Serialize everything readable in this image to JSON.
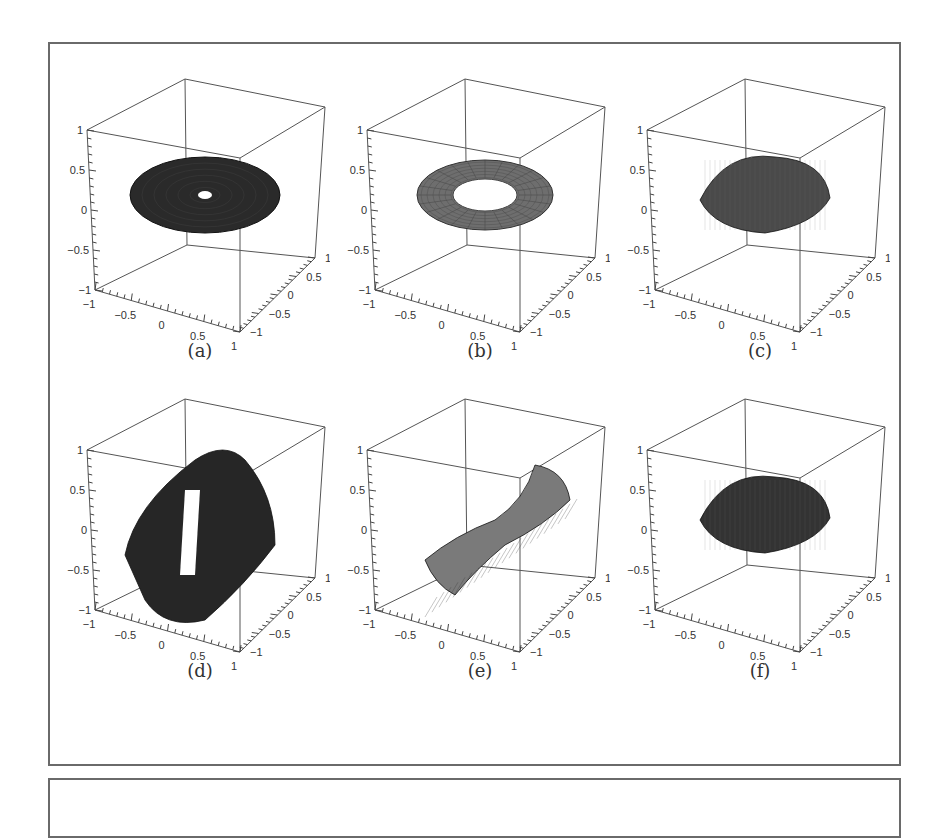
{
  "figure": {
    "panels": [
      {
        "id": "a",
        "caption": "(a)",
        "surface": "disk-with-small-hole",
        "shade": "#2a2a2a"
      },
      {
        "id": "b",
        "caption": "(b)",
        "surface": "annulus-ring",
        "shade": "#6e6e6e"
      },
      {
        "id": "c",
        "caption": "(c)",
        "surface": "ellipsoid-lens",
        "shade": "#4a4a4a"
      },
      {
        "id": "d",
        "caption": "(d)",
        "surface": "twisted-band-with-slit",
        "shade": "#262626"
      },
      {
        "id": "e",
        "caption": "(e)",
        "surface": "twisted-ribbon",
        "shade": "#7a7a7a"
      },
      {
        "id": "f",
        "caption": "(f)",
        "surface": "ellipsoid-lens",
        "shade": "#333333"
      }
    ],
    "axis_ticks": {
      "z": [
        "1",
        "0.5",
        "0",
        "−0.5",
        "−1"
      ],
      "x": [
        "−1",
        "−0.5",
        "0",
        "0.5",
        "1"
      ],
      "y": [
        "1",
        "0.5",
        "0",
        "−0.5",
        "−1"
      ]
    }
  },
  "chart_data": [
    {
      "type": "surface3d",
      "title": "(a)",
      "xlim": [
        -1,
        1
      ],
      "ylim": [
        -1,
        1
      ],
      "zlim": [
        -1,
        1
      ],
      "xticks": [
        -1,
        -0.5,
        0,
        0.5,
        1
      ],
      "yticks": [
        -1,
        -0.5,
        0,
        0.5,
        1
      ],
      "zticks": [
        -1,
        -0.5,
        0,
        0.5,
        1
      ],
      "description": "flat dark disk at z=0 with small central hole"
    },
    {
      "type": "surface3d",
      "title": "(b)",
      "xlim": [
        -1,
        1
      ],
      "ylim": [
        -1,
        1
      ],
      "zlim": [
        -1,
        1
      ],
      "description": "flat annulus at z=0 with large central hole, mesh visible"
    },
    {
      "type": "surface3d",
      "title": "(c)",
      "xlim": [
        -1,
        1
      ],
      "ylim": [
        -1,
        1
      ],
      "zlim": [
        -1,
        1
      ],
      "description": "closed lens/ellipsoid shape centred at origin, fine mesh"
    },
    {
      "type": "surface3d",
      "title": "(d)",
      "xlim": [
        -1,
        1
      ],
      "ylim": [
        -1,
        1
      ],
      "zlim": [
        -1,
        1
      ],
      "description": "dark twisted band spanning z from about -1 to 1 with a vertical slit"
    },
    {
      "type": "surface3d",
      "title": "(e)",
      "xlim": [
        -1,
        1
      ],
      "ylim": [
        -1,
        1
      ],
      "zlim": [
        -1,
        1
      ],
      "description": "light grey twisted ribbon along diagonal"
    },
    {
      "type": "surface3d",
      "title": "(f)",
      "xlim": [
        -1,
        1
      ],
      "ylim": [
        -1,
        1
      ],
      "zlim": [
        -1,
        1
      ],
      "description": "dark closed lens/ellipsoid centred at origin"
    }
  ]
}
